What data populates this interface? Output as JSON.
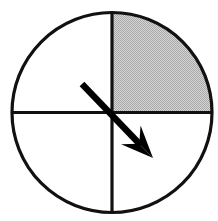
{
  "figure": {
    "name": "spinner-diagram",
    "kind": "probability-spinner",
    "width": 218,
    "height": 221,
    "background_color": "#ffffff"
  },
  "chart_data": {
    "type": "pie",
    "title": "",
    "subtitle": "",
    "xlabel": "",
    "ylabel": "",
    "legend_position": "none",
    "grid": false,
    "categories": [
      "upper-right quadrant",
      "upper-left quadrant",
      "lower-left quadrant",
      "lower-right quadrant"
    ],
    "values": [
      25,
      25,
      25,
      25
    ],
    "labels": [
      "",
      "",
      "",
      ""
    ],
    "slice_colors": [
      "#c4c4c4",
      "#ffffff",
      "#ffffff",
      "#ffffff"
    ],
    "shaded_slices": [
      "upper-right quadrant"
    ],
    "start_angle_deg": 90,
    "direction": "clockwise",
    "annotations": [
      {
        "name": "spinner-arrow",
        "kind": "arrow",
        "points_to": "lower-right quadrant",
        "angle_deg": 315,
        "color": "#000000"
      }
    ]
  },
  "geometry": {
    "circle": {
      "center_x": 112,
      "center_y": 112.5,
      "radius": 100,
      "stroke_color": "#111111",
      "stroke_width": 3.2,
      "fill_color": "#ffffff"
    },
    "divider_vertical": {
      "x": 112,
      "y_top": 12.5,
      "y_bottom": 212.5,
      "stroke_color": "#111111",
      "stroke_width": 3.2
    },
    "divider_horizontal": {
      "y": 112.5,
      "x_left": 12,
      "x_right": 212,
      "stroke_color": "#111111",
      "stroke_width": 3.2
    },
    "shaded_quadrant": {
      "fill_color": "#c4c4c4",
      "texture": "halftone-dither",
      "quadrant": "upper-right"
    },
    "arrow": {
      "tail_x": 82,
      "tail_y": 84,
      "tip_x": 153,
      "tip_y": 158,
      "shaft_width": 6.5,
      "head_length": 32,
      "head_width": 27,
      "color": "#000000"
    }
  }
}
